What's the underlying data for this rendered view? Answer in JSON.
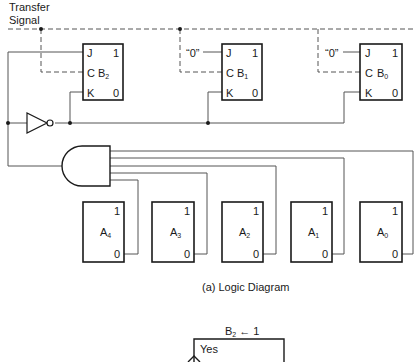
{
  "transfer_signal": {
    "line1": "Transfer",
    "line2": "Signal"
  },
  "flip_flops_B": [
    {
      "name": "B",
      "sub": "2",
      "j_input": "",
      "pins": {
        "j": "J",
        "c": "C",
        "k": "K",
        "one": "1",
        "zero": "0"
      }
    },
    {
      "name": "B",
      "sub": "1",
      "j_input": "“0”",
      "pins": {
        "j": "J",
        "c": "C",
        "k": "K",
        "one": "1",
        "zero": "0"
      }
    },
    {
      "name": "B",
      "sub": "0",
      "j_input": "“0”",
      "pins": {
        "j": "J",
        "c": "C",
        "k": "K",
        "one": "1",
        "zero": "0"
      }
    }
  ],
  "registers_A": [
    {
      "name": "A",
      "sub": "4",
      "one": "1",
      "zero": "0"
    },
    {
      "name": "A",
      "sub": "3",
      "one": "1",
      "zero": "0"
    },
    {
      "name": "A",
      "sub": "2",
      "one": "1",
      "zero": "0"
    },
    {
      "name": "A",
      "sub": "1",
      "one": "1",
      "zero": "0"
    },
    {
      "name": "A",
      "sub": "0",
      "one": "1",
      "zero": "0"
    }
  ],
  "gates": {
    "inverter": "NOT",
    "and": "AND"
  },
  "caption": "(a)  Logic Diagram",
  "flowchart": {
    "action_name": "B",
    "action_sub": "2",
    "action_rest": " ← 1",
    "branch_label": "Yes"
  },
  "colors": {
    "line": "#1a1a1a",
    "wire": "#555555"
  }
}
